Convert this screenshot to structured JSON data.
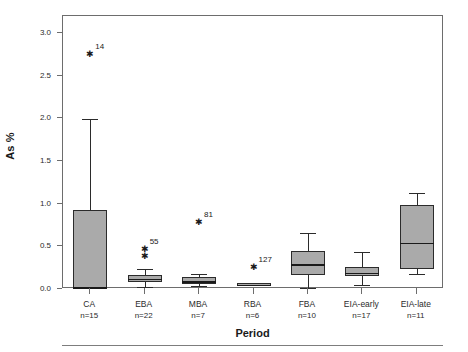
{
  "chart_data": {
    "type": "box",
    "title": "",
    "xlabel": "Period",
    "ylabel": "As %",
    "ylim": [
      0.0,
      3.2
    ],
    "yticks": [
      "0.0",
      "0.5",
      "1.0",
      "1.5",
      "2.0",
      "2.5",
      "3.0"
    ],
    "ytick_values": [
      0.0,
      0.5,
      1.0,
      1.5,
      2.0,
      2.5,
      3.0
    ],
    "grid": false,
    "legend": "none",
    "categories": [
      "CA",
      "EBA",
      "MBA",
      "RBA",
      "FBA",
      "EIA-early",
      "EIA-late"
    ],
    "counts": [
      "n=15",
      "n=22",
      "n=7",
      "n=6",
      "n=10",
      "n=17",
      "n=11"
    ],
    "boxes": [
      {
        "category": "CA",
        "count": "n=15",
        "whisker_low": 0.01,
        "q1": 0.01,
        "median": 0.02,
        "q3": 0.93,
        "whisker_high": 1.99
      },
      {
        "category": "EBA",
        "count": "n=22",
        "whisker_low": 0.02,
        "q1": 0.08,
        "median": 0.12,
        "q3": 0.16,
        "whisker_high": 0.23
      },
      {
        "category": "MBA",
        "count": "n=7",
        "whisker_low": 0.04,
        "q1": 0.06,
        "median": 0.09,
        "q3": 0.14,
        "whisker_high": 0.17
      },
      {
        "category": "RBA",
        "count": "n=6",
        "whisker_low": 0.04,
        "q1": 0.04,
        "median": 0.05,
        "q3": 0.07,
        "whisker_high": 0.07
      },
      {
        "category": "FBA",
        "count": "n=10",
        "whisker_low": 0.01,
        "q1": 0.16,
        "median": 0.29,
        "q3": 0.44,
        "whisker_high": 0.66
      },
      {
        "category": "EIA-early",
        "count": "n=17",
        "whisker_low": 0.05,
        "q1": 0.15,
        "median": 0.19,
        "q3": 0.26,
        "whisker_high": 0.43
      },
      {
        "category": "EIA-late",
        "count": "n=11",
        "whisker_low": 0.17,
        "q1": 0.24,
        "median": 0.54,
        "q3": 0.98,
        "whisker_high": 1.13
      }
    ],
    "outliers": [
      {
        "category": "CA",
        "value": 2.75,
        "label": "14"
      },
      {
        "category": "EBA",
        "value": 0.47,
        "label": "55"
      },
      {
        "category": "EBA",
        "value": 0.39,
        "label": ""
      },
      {
        "category": "MBA",
        "value": 0.79,
        "label": "81"
      },
      {
        "category": "RBA",
        "value": 0.26,
        "label": "127"
      }
    ],
    "colors": {
      "box_fill": "#aaaaaa",
      "box_edge": "#2b2b2b",
      "axis": "#6d6d6d",
      "background": "#ffffff"
    }
  }
}
